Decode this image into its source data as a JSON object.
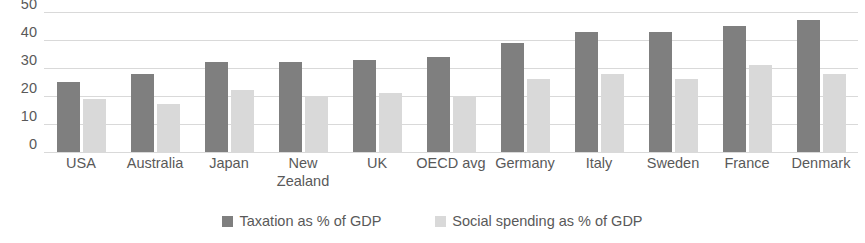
{
  "chart_data": {
    "type": "bar",
    "title": "",
    "subtitle": "",
    "xlabel": "",
    "ylabel": "",
    "ylim": [
      0,
      50
    ],
    "yticks": [
      50,
      40,
      30,
      20,
      10,
      0
    ],
    "grid": true,
    "legend_position": "bottom",
    "categories": [
      "USA",
      "Australia",
      "Japan",
      "New\nZealand",
      "UK",
      "OECD avg",
      "Germany",
      "Italy",
      "Sweden",
      "France",
      "Denmark"
    ],
    "series": [
      {
        "name": "Taxation as % of GDP",
        "color": "#7f7f7f",
        "values": [
          25,
          28,
          32,
          32,
          33,
          34,
          39,
          43,
          43,
          45,
          47
        ]
      },
      {
        "name": "Social spending as % of GDP",
        "color": "#d9d9d9",
        "values": [
          19,
          17,
          22,
          20,
          21,
          20,
          26,
          28,
          26,
          31,
          28
        ]
      }
    ]
  },
  "legend": {
    "items": [
      {
        "label": "Taxation as % of GDP",
        "swatch": "taxation"
      },
      {
        "label": "Social spending as % of GDP",
        "swatch": "social"
      }
    ]
  },
  "colors": {
    "taxation": "#7f7f7f",
    "social": "#d9d9d9",
    "gridline": "#d9d9d9",
    "text": "#595959",
    "background": "#ffffff"
  }
}
